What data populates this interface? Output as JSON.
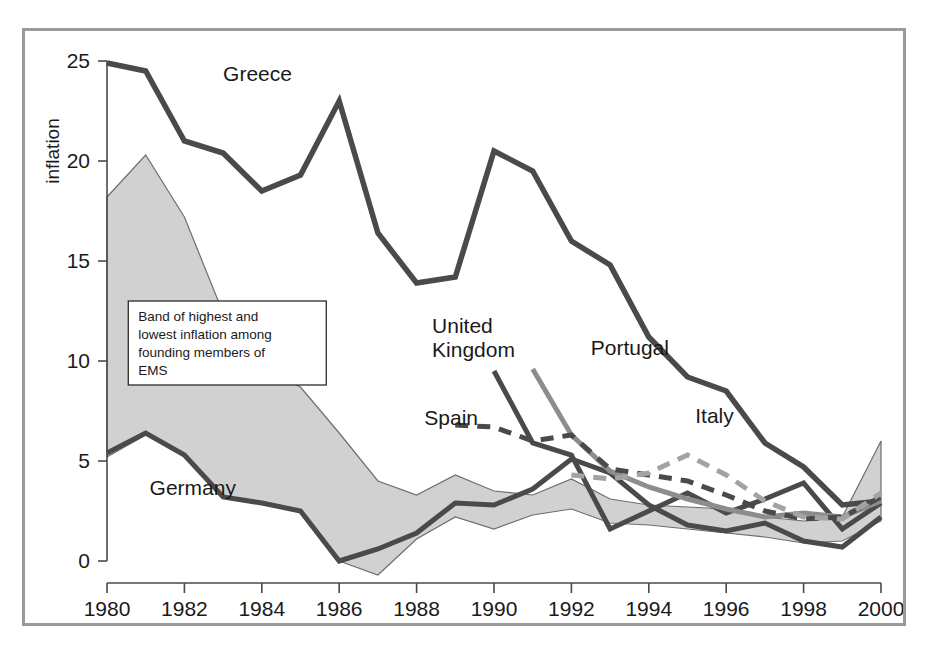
{
  "chart_data": {
    "type": "line",
    "title": "",
    "xlabel": "",
    "ylabel": "inflation",
    "xlim": [
      1980,
      2000
    ],
    "ylim": [
      0,
      25
    ],
    "grid": false,
    "legend_position": "inline-labels",
    "x_ticks": [
      1980,
      1982,
      1984,
      1986,
      1988,
      1990,
      1992,
      1994,
      1996,
      1998,
      2000
    ],
    "y_ticks": [
      0,
      5,
      10,
      15,
      20,
      25
    ],
    "x_tick_labels": [
      "1980",
      "1982",
      "1984",
      "1986",
      "1988",
      "1990",
      "1992",
      "1994",
      "1996",
      "1998",
      "2000"
    ],
    "y_tick_labels": [
      "0",
      "5",
      "10",
      "15",
      "20",
      "25"
    ],
    "annotations": [
      {
        "id": "ems-band-note",
        "lines": [
          "Band of highest and",
          "lowest inflation among",
          "founding members of",
          "EMS"
        ]
      }
    ],
    "band": {
      "name": "Band of highest and lowest inflation among founding members of EMS",
      "style": "shaded-area",
      "color": "#c9c9c9",
      "x": [
        1980,
        1981,
        1982,
        1983,
        1984,
        1985,
        1986,
        1987,
        1988,
        1989,
        1990,
        1991,
        1992,
        1993,
        1994,
        1995,
        1996,
        1997,
        1998,
        1999,
        2000
      ],
      "upper": [
        18.2,
        20.3,
        17.2,
        12.4,
        9.6,
        8.7,
        6.4,
        4.0,
        3.3,
        4.3,
        3.5,
        3.3,
        4.1,
        3.1,
        2.8,
        2.7,
        2.6,
        2.2,
        2.0,
        2.2,
        6.0
      ],
      "lower": [
        5.2,
        6.3,
        5.3,
        3.2,
        2.9,
        2.5,
        0.0,
        -0.7,
        1.1,
        2.2,
        1.6,
        2.3,
        2.6,
        1.9,
        1.8,
        1.6,
        1.4,
        1.2,
        0.9,
        1.0,
        2.0
      ]
    },
    "series": [
      {
        "name": "Greece",
        "label": "Greece",
        "color": "#4a4a4a",
        "style": "solid",
        "x": [
          1980,
          1981,
          1982,
          1983,
          1984,
          1985,
          1986,
          1987,
          1988,
          1989,
          1990,
          1991,
          1992,
          1993,
          1994,
          1995,
          1996,
          1997,
          1998,
          1999,
          2000
        ],
        "values": [
          24.9,
          24.5,
          21.0,
          20.4,
          18.5,
          19.3,
          23.0,
          16.4,
          13.9,
          14.2,
          20.5,
          19.5,
          16.0,
          14.8,
          11.2,
          9.2,
          8.5,
          5.9,
          4.7,
          2.8,
          3.0
        ]
      },
      {
        "name": "Germany",
        "label": "Germany",
        "color": "#4a4a4a",
        "style": "solid",
        "x": [
          1980,
          1981,
          1982,
          1983,
          1984,
          1985,
          1986,
          1987,
          1988,
          1989,
          1990,
          1991,
          1992,
          1993,
          1994,
          1995,
          1996,
          1997,
          1998,
          1999,
          2000
        ],
        "values": [
          5.4,
          6.4,
          5.3,
          3.2,
          2.9,
          2.5,
          0.0,
          0.6,
          1.4,
          2.9,
          2.8,
          3.6,
          5.1,
          4.4,
          2.8,
          1.8,
          1.5,
          1.9,
          1.0,
          0.7,
          2.2
        ]
      },
      {
        "name": "United Kingdom",
        "label": "United Kingdom",
        "color": "#4a4a4a",
        "style": "solid",
        "x": [
          1990,
          1991,
          1992,
          1993,
          1994,
          1995,
          1996,
          1997,
          1998,
          1999,
          2000
        ],
        "values": [
          9.5,
          5.9,
          5.3,
          1.6,
          2.5,
          3.4,
          2.4,
          3.1,
          3.9,
          1.6,
          2.9
        ]
      },
      {
        "name": "Portugal",
        "label": "Portugal",
        "color": "#8d8d8d",
        "style": "solid",
        "x": [
          1991,
          1992,
          1993,
          1994,
          1995,
          1996,
          1997,
          1998,
          1999,
          2000
        ],
        "values": [
          9.6,
          6.3,
          4.5,
          3.7,
          3.1,
          2.6,
          2.2,
          2.4,
          2.2,
          3.0
        ]
      },
      {
        "name": "Spain",
        "label": "Spain",
        "color": "#4a4a4a",
        "style": "dashed",
        "x": [
          1989,
          1990,
          1991,
          1992,
          1993,
          1994,
          1995,
          1996,
          1997,
          1998,
          1999,
          2000
        ],
        "values": [
          6.8,
          6.7,
          6.0,
          6.3,
          4.6,
          4.3,
          4.0,
          3.3,
          2.5,
          2.1,
          2.2,
          3.2
        ]
      },
      {
        "name": "Italy",
        "label": "Italy",
        "color": "#a3a3a3",
        "style": "dashed",
        "x": [
          1992,
          1993,
          1994,
          1995,
          1996,
          1997,
          1998,
          1999,
          2000
        ],
        "values": [
          4.3,
          4.1,
          4.4,
          5.3,
          4.3,
          3.0,
          2.2,
          2.1,
          3.4
        ]
      }
    ],
    "series_label_positions": [
      {
        "name": "Greece",
        "x": 1983.0,
        "y": 24.0
      },
      {
        "name": "Germany",
        "x": 1981.1,
        "y": 3.3
      },
      {
        "name": "United Kingdom",
        "x": 1988.4,
        "y": 11.4
      },
      {
        "name": "Portugal",
        "x": 1992.5,
        "y": 10.3
      },
      {
        "name": "Spain",
        "x": 1988.2,
        "y": 6.8
      },
      {
        "name": "Italy",
        "x": 1995.2,
        "y": 6.9
      }
    ]
  }
}
